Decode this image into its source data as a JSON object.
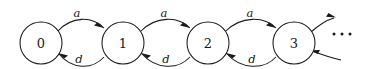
{
  "diagram": {
    "type": "state-transition-diagram",
    "title": "",
    "background_color": "#ffffff",
    "stroke_color": "#1a1a1a",
    "nodes": [
      {
        "id": "s0",
        "label": "0",
        "cx": 41,
        "cy": 43,
        "r": 21
      },
      {
        "id": "s1",
        "label": "1",
        "cx": 123,
        "cy": 43,
        "r": 21
      },
      {
        "id": "s2",
        "label": "2",
        "cx": 208,
        "cy": 43,
        "r": 21
      },
      {
        "id": "s3",
        "label": "3",
        "cx": 294,
        "cy": 43,
        "r": 21
      }
    ],
    "edges": [
      {
        "id": "e0a",
        "from": "s0",
        "to": "s1",
        "label": "a",
        "direction": "right",
        "label_x": 77,
        "label_y": 13
      },
      {
        "id": "e1a",
        "from": "s1",
        "to": "s2",
        "label": "a",
        "direction": "right",
        "label_x": 164,
        "label_y": 13
      },
      {
        "id": "e2a",
        "from": "s2",
        "to": "s3",
        "label": "a",
        "direction": "right",
        "label_x": 250,
        "label_y": 13
      },
      {
        "id": "e3a",
        "from": "s3",
        "to": "next",
        "label": "",
        "direction": "right",
        "label_x": 0,
        "label_y": 0
      },
      {
        "id": "e1d",
        "from": "s1",
        "to": "s0",
        "label": "d",
        "direction": "left",
        "label_x": 79,
        "label_y": 59
      },
      {
        "id": "e2d",
        "from": "s2",
        "to": "s1",
        "label": "d",
        "direction": "left",
        "label_x": 166,
        "label_y": 59
      },
      {
        "id": "e3d",
        "from": "s3",
        "to": "s2",
        "label": "d",
        "direction": "left",
        "label_x": 252,
        "label_y": 59
      },
      {
        "id": "e4d",
        "from": "next",
        "to": "s3",
        "label": "",
        "direction": "left",
        "label_x": 0,
        "label_y": 0
      }
    ],
    "continuation": {
      "symbol": "...",
      "dots": [
        {
          "cx": 334,
          "cy": 34,
          "r": 1.5
        },
        {
          "cx": 342,
          "cy": 34,
          "r": 1.5
        },
        {
          "cx": 350,
          "cy": 34,
          "r": 1.5
        }
      ]
    }
  }
}
